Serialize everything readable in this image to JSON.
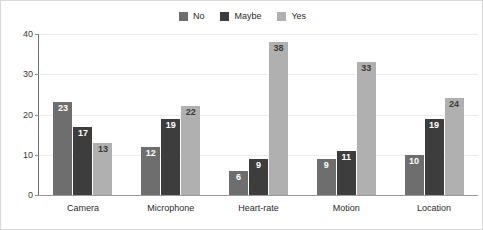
{
  "chart_data": {
    "type": "bar",
    "title": "",
    "subtitle": "",
    "xlabel": "",
    "ylabel": "",
    "categories": [
      "Camera",
      "Microphone",
      "Heart-rate",
      "Motion",
      "Location"
    ],
    "series": [
      {
        "name": "No",
        "color": "#6e6e6e",
        "values": [
          23,
          12,
          6,
          9,
          10
        ]
      },
      {
        "name": "Maybe",
        "color": "#3d3d3d",
        "values": [
          17,
          19,
          9,
          11,
          19
        ]
      },
      {
        "name": "Yes",
        "color": "#b0b0b0",
        "values": [
          13,
          22,
          38,
          33,
          24
        ]
      }
    ],
    "ylim": [
      0,
      40
    ],
    "yticks": [
      0,
      10,
      20,
      30,
      40
    ],
    "ytick_labels": [
      "0",
      "10",
      "20",
      "30",
      "40"
    ],
    "grid": true,
    "legend_position": "top-center",
    "annotations": "Each bar is labeled with its value",
    "grouping": "grouped"
  },
  "colors": {
    "no": "#6e6e6e",
    "maybe": "#3d3d3d",
    "yes": "#b0b0b0",
    "grid": "#ececec",
    "axis": "#8d8d8d",
    "border": "#d9d9d9",
    "text": "#2b2b2b",
    "bar_label": "#ffffff"
  }
}
